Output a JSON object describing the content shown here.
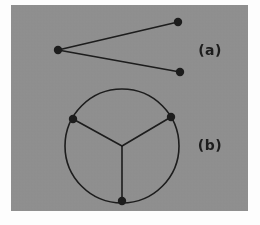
{
  "figure": {
    "background_color": "#fdfdfd",
    "panel_color": "#8e8e8e",
    "ink_color": "#1c1c1c",
    "panel": {
      "x": 11,
      "y": 5,
      "width": 237,
      "height": 206
    },
    "stroke_width": 1.6,
    "node_radius": 4.2,
    "subfigures": [
      {
        "id": "a",
        "label": "(a)",
        "label_x": 210,
        "label_y": 55,
        "type": "path-graph",
        "description": "three vertices joined by two straight edges forming an open V",
        "nodes": [
          {
            "name": "apex-left",
            "x": 58,
            "y": 50
          },
          {
            "name": "upper-right",
            "x": 178,
            "y": 22
          },
          {
            "name": "lower-right",
            "x": 180,
            "y": 72
          }
        ],
        "edges": [
          {
            "from": "apex-left",
            "to": "upper-right"
          },
          {
            "from": "apex-left",
            "to": "lower-right"
          }
        ]
      },
      {
        "id": "b",
        "label": "(b)",
        "label_x": 210,
        "label_y": 150,
        "type": "wheel-graph",
        "description": "circle with three boundary vertices joined by spokes to a central hub",
        "circle": {
          "cx": 122,
          "cy": 146,
          "r": 57
        },
        "hub": {
          "name": "center",
          "x": 122,
          "y": 146
        },
        "nodes": [
          {
            "name": "upper-left",
            "x": 73,
            "y": 119
          },
          {
            "name": "upper-right",
            "x": 171,
            "y": 117
          },
          {
            "name": "bottom",
            "x": 122,
            "y": 201
          }
        ],
        "edges": [
          {
            "from": "center",
            "to": "upper-left"
          },
          {
            "from": "center",
            "to": "upper-right"
          },
          {
            "from": "center",
            "to": "bottom"
          }
        ]
      }
    ]
  }
}
